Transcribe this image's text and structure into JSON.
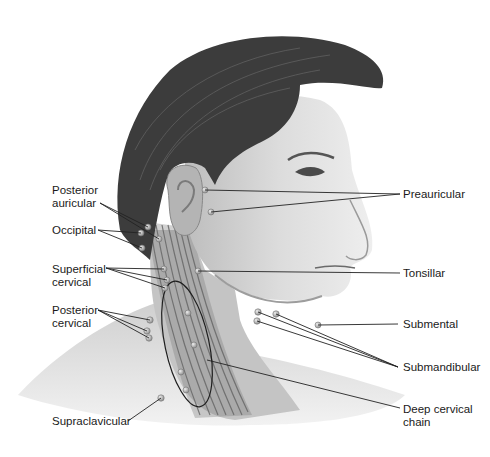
{
  "diagram": {
    "colors": {
      "background": "#ffffff",
      "skin_light": "#e6e6e6",
      "skin_mid": "#c8c8c8",
      "skin_dark": "#9a9a9a",
      "hair": "#3a3a3a",
      "muscle": "#6e6e6e",
      "node": "#b5b5b5",
      "leader_line": "#222222",
      "label_text": "#1a1a1a"
    },
    "labels_left": [
      {
        "id": "posterior-auricular",
        "text": "Posterior\nauricular"
      },
      {
        "id": "occipital",
        "text": "Occipital"
      },
      {
        "id": "superficial-cervical",
        "text": "Superficial\ncervical"
      },
      {
        "id": "posterior-cervical",
        "text": "Posterior\ncervical"
      },
      {
        "id": "supraclavicular",
        "text": "Supraclavicular"
      }
    ],
    "labels_right": [
      {
        "id": "preauricular",
        "text": "Preauricular"
      },
      {
        "id": "tonsillar",
        "text": "Tonsillar"
      },
      {
        "id": "submental",
        "text": "Submental"
      },
      {
        "id": "submandibular",
        "text": "Submandibular"
      },
      {
        "id": "deep-cervical-chain",
        "text": "Deep cervical\nchain"
      }
    ]
  }
}
